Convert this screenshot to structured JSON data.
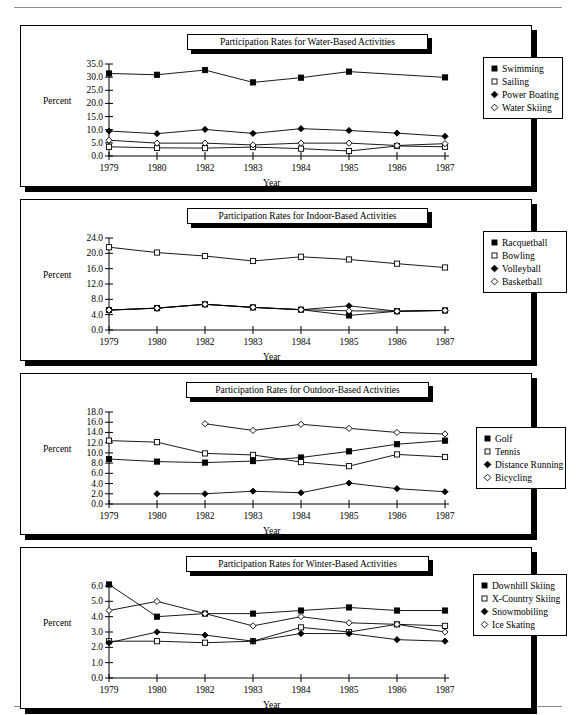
{
  "page": {
    "axis": {
      "ylabel": "Percent",
      "xlabel": "Year"
    },
    "years": [
      "1979",
      "1980",
      "1982",
      "1983",
      "1984",
      "1985",
      "1986",
      "1987"
    ]
  },
  "charts": [
    {
      "id": "water",
      "title": "Participation Rates for Water-Based Activities",
      "chart_data": {
        "type": "line",
        "title": "Participation Rates for Water-Based Activities",
        "xlabel": "Year",
        "ylabel": "Percent",
        "categories": [
          "1979",
          "1980",
          "1982",
          "1983",
          "1984",
          "1985",
          "1986",
          "1987"
        ],
        "ylim": [
          0.0,
          35.0
        ],
        "ytick_step": 5.0,
        "yticks": [
          "0.0",
          "5.0",
          "10.0",
          "15.0",
          "20.0",
          "25.0",
          "30.0",
          "35.0"
        ],
        "grid": false,
        "legend_position": "right",
        "series": [
          {
            "name": "Swimming",
            "marker": "filled-square",
            "values": [
              31.4,
              30.9,
              32.7,
              28.0,
              29.8,
              32.1,
              null,
              29.9
            ]
          },
          {
            "name": "Sailing",
            "marker": "open-square",
            "values": [
              3.5,
              3.1,
              3.0,
              3.4,
              2.8,
              1.9,
              3.8,
              3.5
            ]
          },
          {
            "name": "Power Boating",
            "marker": "filled-diamond",
            "values": [
              9.5,
              8.5,
              10.1,
              8.6,
              10.4,
              9.7,
              8.7,
              7.5
            ]
          },
          {
            "name": "Water Skiing",
            "marker": "open-diamond",
            "values": [
              6.0,
              4.9,
              4.9,
              4.2,
              4.9,
              4.9,
              4.0,
              4.7
            ]
          }
        ]
      },
      "legend": [
        {
          "label": "Swimming",
          "marker": "filled-square"
        },
        {
          "label": "Sailing",
          "marker": "open-square"
        },
        {
          "label": "Power Boating",
          "marker": "filled-diamond"
        },
        {
          "label": "Water Skiing",
          "marker": "open-diamond"
        }
      ]
    },
    {
      "id": "indoor",
      "title": "Participation Rates for Indoor-Based Activities",
      "chart_data": {
        "type": "line",
        "title": "Participation Rates for Indoor-Based Activities",
        "xlabel": "Year",
        "ylabel": "Percent",
        "categories": [
          "1979",
          "1980",
          "1982",
          "1983",
          "1984",
          "1985",
          "1986",
          "1987"
        ],
        "ylim": [
          0.0,
          24.0
        ],
        "ytick_step": 4.0,
        "yticks": [
          "0.0",
          "4.0",
          "8.0",
          "12.0",
          "16.0",
          "20.0",
          "24.0"
        ],
        "grid": false,
        "legend_position": "right",
        "series": [
          {
            "name": "Racquetball",
            "marker": "filled-square",
            "values": [
              5.2,
              5.7,
              6.7,
              5.9,
              5.3,
              3.8,
              4.9,
              5.1
            ]
          },
          {
            "name": "Bowling",
            "marker": "open-square",
            "values": [
              21.6,
              20.2,
              19.3,
              18.0,
              19.1,
              18.4,
              17.3,
              16.3
            ]
          },
          {
            "name": "Volleyball",
            "marker": "filled-diamond",
            "values": [
              5.2,
              5.7,
              6.7,
              5.9,
              5.3,
              6.3,
              4.9,
              5.1
            ]
          },
          {
            "name": "Basketball",
            "marker": "open-diamond",
            "values": [
              5.2,
              5.7,
              6.7,
              5.9,
              5.3,
              5.0,
              4.9,
              5.1
            ]
          }
        ]
      },
      "legend": [
        {
          "label": "Racquetball",
          "marker": "filled-square"
        },
        {
          "label": "Bowling",
          "marker": "open-square"
        },
        {
          "label": "Volleyball",
          "marker": "filled-diamond"
        },
        {
          "label": "Basketball",
          "marker": "open-diamond"
        }
      ]
    },
    {
      "id": "outdoor",
      "title": "Participation Rates for Outdoor-Based Activities",
      "chart_data": {
        "type": "line",
        "title": "Participation Rates for Outdoor-Based Activities",
        "xlabel": "Year",
        "ylabel": "Percent",
        "categories": [
          "1979",
          "1980",
          "1982",
          "1983",
          "1984",
          "1985",
          "1986",
          "1987"
        ],
        "ylim": [
          0.0,
          18.0
        ],
        "ytick_step": 2.0,
        "yticks": [
          "0.0",
          "2.0",
          "4.0",
          "6.0",
          "8.0",
          "10.0",
          "12.0",
          "14.0",
          "16.0",
          "18.0"
        ],
        "grid": false,
        "legend_position": "right",
        "series": [
          {
            "name": "Golf",
            "marker": "filled-square",
            "values": [
              8.8,
              8.3,
              8.1,
              8.4,
              9.1,
              10.3,
              11.7,
              12.4
            ]
          },
          {
            "name": "Tennis",
            "marker": "open-square",
            "values": [
              12.4,
              12.1,
              9.9,
              9.6,
              8.2,
              7.4,
              9.7,
              9.2
            ]
          },
          {
            "name": "Distance Running",
            "marker": "filled-diamond",
            "values": [
              null,
              2.0,
              2.0,
              2.5,
              2.2,
              4.1,
              3.0,
              2.4
            ]
          },
          {
            "name": "Bicycling",
            "marker": "open-diamond",
            "values": [
              null,
              null,
              15.7,
              14.4,
              15.6,
              14.8,
              14.0,
              13.7
            ]
          }
        ]
      },
      "legend": [
        {
          "label": "Golf",
          "marker": "filled-square"
        },
        {
          "label": "Tennis",
          "marker": "open-square"
        },
        {
          "label": "Distance Running",
          "marker": "filled-diamond"
        },
        {
          "label": "Bicycling",
          "marker": "open-diamond"
        }
      ]
    },
    {
      "id": "winter",
      "title": "Participation Rates for Winter-Based Activities",
      "chart_data": {
        "type": "line",
        "title": "Participation Rates for Winter-Based Activities",
        "xlabel": "Year",
        "ylabel": "Percent",
        "categories": [
          "1979",
          "1980",
          "1982",
          "1983",
          "1984",
          "1985",
          "1986",
          "1987"
        ],
        "ylim": [
          0.0,
          6.0
        ],
        "ytick_step": 1.0,
        "yticks": [
          "0.0",
          "1.0",
          "2.0",
          "3.0",
          "4.0",
          "5.0",
          "6.0"
        ],
        "grid": false,
        "legend_position": "right",
        "series": [
          {
            "name": "Downhill Skiing",
            "marker": "filled-square",
            "values": [
              6.1,
              4.0,
              4.2,
              4.2,
              4.4,
              4.6,
              4.4,
              4.4
            ]
          },
          {
            "name": "X-Country Skiing",
            "marker": "open-square",
            "values": [
              2.4,
              2.4,
              2.3,
              2.4,
              3.3,
              3.0,
              3.5,
              3.4
            ]
          },
          {
            "name": "Snowmobiling",
            "marker": "filled-diamond",
            "values": [
              2.3,
              3.0,
              2.8,
              2.4,
              2.9,
              2.9,
              2.5,
              2.4
            ]
          },
          {
            "name": "Ice Skating",
            "marker": "open-diamond",
            "values": [
              4.4,
              5.0,
              4.2,
              3.4,
              4.0,
              3.6,
              3.5,
              3.0
            ]
          }
        ]
      },
      "legend": [
        {
          "label": "Downhill Skiing",
          "marker": "filled-square"
        },
        {
          "label": "X-Country Skiing",
          "marker": "open-square"
        },
        {
          "label": "Snowmobiling",
          "marker": "filled-diamond"
        },
        {
          "label": "Ice Skating",
          "marker": "open-diamond"
        }
      ]
    }
  ]
}
